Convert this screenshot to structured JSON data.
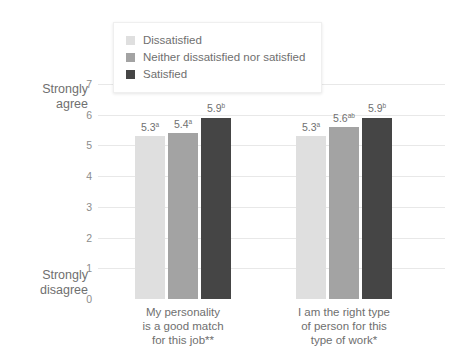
{
  "chart_data": {
    "type": "bar",
    "title": "",
    "xlabel": "",
    "ylabel": "",
    "ylim": [
      0,
      7
    ],
    "yticks": [
      "0",
      "1",
      "2",
      "3",
      "4",
      "5",
      "6",
      "7"
    ],
    "grid": true,
    "legend_position": "top-center",
    "axis_labels": {
      "top": "Strongly\nagree",
      "top_line1": "Strongly",
      "top_line2": "agree",
      "bottom_line1": "Strongly",
      "bottom_line2": "disagree"
    },
    "categories": [
      {
        "line1": "My personality",
        "line2": "is a good match",
        "line3": "for this job**"
      },
      {
        "line1": "I am the right type",
        "line2": "of person for this",
        "line3": "type of work*"
      }
    ],
    "series": [
      {
        "name": "Dissatisfied",
        "color": "#dfdfdf",
        "values": [
          5.3,
          5.3
        ],
        "labels": [
          "5.3",
          "5.3"
        ],
        "superscripts": [
          "a",
          "a"
        ]
      },
      {
        "name": "Neither dissatisfied nor satisfied",
        "color": "#a3a3a3",
        "values": [
          5.4,
          5.6
        ],
        "labels": [
          "5.4",
          "5.6"
        ],
        "superscripts": [
          "a",
          "ab"
        ]
      },
      {
        "name": "Satisfied",
        "color": "#454545",
        "values": [
          5.9,
          5.9
        ],
        "labels": [
          "5.9",
          "5.9"
        ],
        "superscripts": [
          "b",
          "b"
        ]
      }
    ]
  },
  "legend": {
    "items": [
      {
        "label": "Dissatisfied",
        "color": "#dfdfdf"
      },
      {
        "label": "Neither dissatisfied nor satisfied",
        "color": "#a3a3a3"
      },
      {
        "label": "Satisfied",
        "color": "#454545"
      }
    ]
  }
}
